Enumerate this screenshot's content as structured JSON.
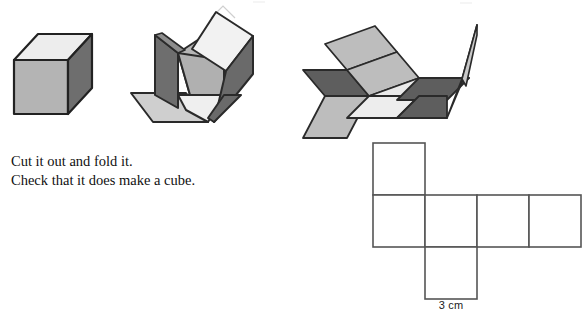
{
  "page": {
    "background_color": "#ffffff",
    "width": 586,
    "height": 319
  },
  "instructions": {
    "line1": "Cut it out and fold it.",
    "line2": "Check that it does make a cube."
  },
  "net": {
    "dimension_label": "3 cm",
    "square_size_px": 52,
    "stroke_color": "#555555",
    "fill_color": "#ffffff",
    "squares": [
      {
        "name": "top-square",
        "x": 373,
        "y": 143
      },
      {
        "name": "left-middle-square",
        "x": 373,
        "y": 195
      },
      {
        "name": "center-middle-square",
        "x": 425,
        "y": 195
      },
      {
        "name": "right-middle-square",
        "x": 477,
        "y": 195
      },
      {
        "name": "far-right-middle-square",
        "x": 529,
        "y": 195
      },
      {
        "name": "bottom-square",
        "x": 425,
        "y": 247
      }
    ]
  },
  "figures": {
    "cube": {
      "label": "solid-cube",
      "top_face_color": "#ededed",
      "front_face_color": "#b3b3b3",
      "side_face_color": "#6e6e6e",
      "stroke_color": "#222222"
    },
    "partly_folded": {
      "label": "partly-folded-net",
      "light_color": "#efefef",
      "mid_color": "#b5b5b5",
      "dark_color": "#6e6e6e",
      "stroke_color": "#2a2a2a"
    },
    "mostly_flat": {
      "label": "mostly-flat-net",
      "light_color": "#efefef",
      "mid_color": "#b5b5b5",
      "dark_color": "#5e5e5e",
      "stroke_color": "#2a2a2a"
    }
  },
  "colors": {
    "ink": "#111111",
    "line": "#555555"
  }
}
